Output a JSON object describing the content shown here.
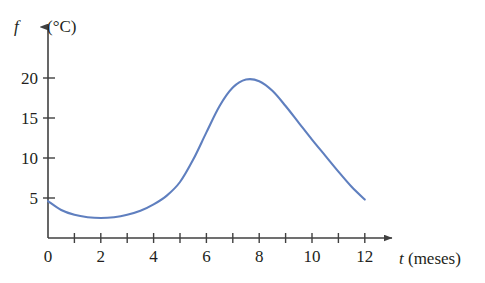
{
  "figure": {
    "background_color": "#ffffff",
    "axis_color": "#404040",
    "curve_color": "#5f7fbf",
    "text_color": "#231f20"
  },
  "axes": {
    "y": {
      "symbol": "f",
      "unit_label": "(°C)",
      "tick_labels": [
        "5",
        "10",
        "15",
        "20"
      ]
    },
    "x": {
      "symbol": "t",
      "unit_label": "(meses)",
      "origin_label": "0",
      "tick_labels": [
        "2",
        "4",
        "6",
        "8",
        "10",
        "12"
      ]
    }
  },
  "chart_data": {
    "type": "line",
    "title": "",
    "subtitle": "",
    "xlabel": "t (meses)",
    "ylabel": "f (°C)",
    "xlim": [
      0,
      12.8
    ],
    "ylim": [
      0,
      22
    ],
    "xticks": [
      0,
      1,
      2,
      3,
      4,
      5,
      6,
      7,
      8,
      9,
      10,
      11,
      12
    ],
    "xticklabels": [
      "0",
      "",
      "2",
      "",
      "4",
      "",
      "6",
      "",
      "8",
      "",
      "10",
      "",
      "12"
    ],
    "yticks": [
      5,
      10,
      15,
      20
    ],
    "yticklabels": [
      "5",
      "10",
      "15",
      "20"
    ],
    "grid": false,
    "legend": false,
    "legend_position": "none",
    "annotations": [],
    "series": [
      {
        "name": "temperatura media mensual",
        "color": "#5f7fbf",
        "x": [
          0,
          0.5,
          1,
          1.5,
          2,
          2.5,
          3,
          3.5,
          4,
          4.5,
          5,
          5.5,
          6,
          6.5,
          7,
          7.5,
          8,
          8.5,
          9,
          9.5,
          10,
          10.5,
          11,
          11.5,
          12
        ],
        "values": [
          4.6,
          3.5,
          2.9,
          2.6,
          2.5,
          2.6,
          2.9,
          3.4,
          4.2,
          5.3,
          7.0,
          9.8,
          13.2,
          16.5,
          18.8,
          19.8,
          19.6,
          18.4,
          16.5,
          14.4,
          12.3,
          10.3,
          8.3,
          6.4,
          4.8
        ]
      }
    ],
    "features": {
      "minimum": {
        "t": 2,
        "f": 2.5
      },
      "maximum": {
        "t": 7.5,
        "f": 19.8
      },
      "start": {
        "t": 0,
        "f": 4.6
      },
      "end": {
        "t": 12,
        "f": 4.8
      }
    }
  }
}
